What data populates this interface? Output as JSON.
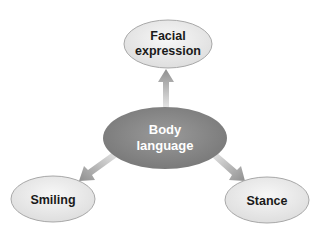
{
  "diagram": {
    "type": "radial-concept-map",
    "center": {
      "label_lines": [
        "Body",
        "language"
      ],
      "fill": "#8c8c8c"
    },
    "nodes": [
      {
        "id": "facial-expression",
        "label_lines": [
          "Facial",
          "expression"
        ]
      },
      {
        "id": "smiling",
        "label_lines": [
          "Smiling"
        ]
      },
      {
        "id": "stance",
        "label_lines": [
          "Stance"
        ]
      }
    ],
    "edges": [
      {
        "from": "body-language",
        "to": "facial-expression"
      },
      {
        "from": "body-language",
        "to": "smiling"
      },
      {
        "from": "body-language",
        "to": "stance"
      }
    ],
    "colors": {
      "outer_fill": "#ebebeb",
      "outer_stroke": "#a8a8a8",
      "arrow": "#9a9a9a"
    }
  }
}
